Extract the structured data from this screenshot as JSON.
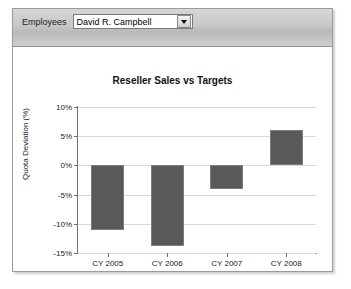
{
  "report": {
    "parameters": [
      {
        "label": "Employees",
        "value": "David R. Campbell",
        "icon": "chevron-down-icon"
      }
    ]
  },
  "chart_data": {
    "type": "bar",
    "title": "Reseller Sales vs Targets",
    "xlabel": "",
    "ylabel": "Quota Deviation (%)",
    "categories": [
      "CY 2005",
      "CY 2006",
      "CY 2007",
      "CY 2008"
    ],
    "values": [
      -11,
      -13.8,
      -4,
      6
    ],
    "ylim": [
      -15,
      10
    ],
    "ytick_values": [
      10,
      5,
      0,
      -5,
      -10,
      -15
    ],
    "ytick_labels": [
      "10%",
      "5%",
      "0%",
      "-5%",
      "-10%",
      "-15%"
    ],
    "grid": true,
    "legend": false,
    "series": [
      {
        "name": "Quota Deviation (%)",
        "color": "#595959",
        "values": [
          -11,
          -13.8,
          -4,
          6
        ]
      }
    ]
  }
}
